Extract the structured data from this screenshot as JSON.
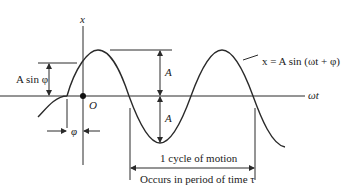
{
  "diagram": {
    "axes": {
      "vertical_label": "x",
      "horizontal_label": "ωt",
      "origin_label": "O"
    },
    "equation_label": "x = A sin (ωt + φ)",
    "amplitude_label_upper": "A",
    "amplitude_label_lower": "A",
    "initial_displacement_label": "A sin φ",
    "phase_label": "φ",
    "cycle_label": "1 cycle of motion",
    "period_label": "Occurs in period of time τ",
    "colors": {
      "line": "#2a2a2a",
      "background": "#ffffff"
    }
  }
}
